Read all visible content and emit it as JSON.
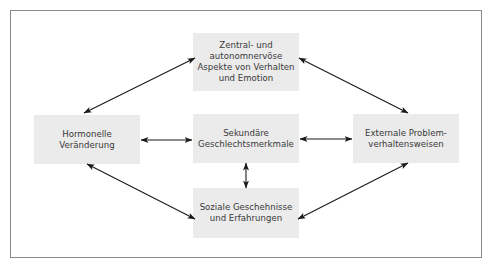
{
  "diagram": {
    "nodes": {
      "top": {
        "label": "Zentral- und\nautonomnervöse\nAspekte von Verhalten\nund Emotion"
      },
      "left": {
        "label": "Hormonelle\nVeränderung"
      },
      "center": {
        "label": "Sekundäre\nGeschlechtsmerkmale"
      },
      "right": {
        "label": "Externale Problem-\nverhaltensweisen"
      },
      "bottom": {
        "label": "Soziale Geschehnisse\nund Erfahrungen"
      }
    },
    "edges": [
      {
        "from": "left",
        "to": "top",
        "type": "bidirectional"
      },
      {
        "from": "top",
        "to": "right",
        "type": "bidirectional"
      },
      {
        "from": "left",
        "to": "center",
        "type": "bidirectional"
      },
      {
        "from": "center",
        "to": "right",
        "type": "bidirectional"
      },
      {
        "from": "center",
        "to": "bottom",
        "type": "bidirectional"
      },
      {
        "from": "left",
        "to": "bottom",
        "type": "bidirectional"
      },
      {
        "from": "bottom",
        "to": "right",
        "type": "bidirectional"
      }
    ],
    "colors": {
      "node_fill": "#ebebeb",
      "text": "#3a3a3a",
      "arrow": "#1a1a1a",
      "frame": "#8a8a8a"
    }
  }
}
